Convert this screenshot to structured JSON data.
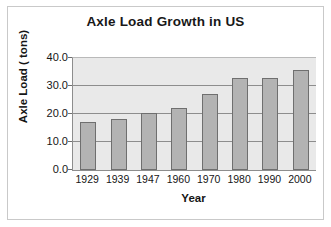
{
  "figure": {
    "title": "Axle Load Growth in US",
    "background_color": "#ffffff",
    "frame_color": "#c9c9c9",
    "plot_background_color": "#e9e9e9",
    "bar_fill_color": "#b3b3b3",
    "bar_border_color": "#6f6f6f",
    "gridline_color": "#8d8d8d",
    "text_color": "#161616"
  },
  "chart_data": {
    "type": "bar",
    "title": "Axle Load Growth in US",
    "xlabel": "Year",
    "ylabel": "Axle Load ( tons)",
    "categories": [
      "1929",
      "1939",
      "1947",
      "1960",
      "1970",
      "1980",
      "1990",
      "2000"
    ],
    "values": [
      17.3,
      18.2,
      20.3,
      22.0,
      27.0,
      32.8,
      32.9,
      35.8
    ],
    "ylim": [
      0.0,
      40.0
    ],
    "ytick_labels": [
      "40.0",
      "30.0",
      "20.0",
      "10.0",
      "0.0"
    ],
    "ytick_values": [
      40.0,
      30.0,
      20.0,
      10.0,
      0.0
    ],
    "grid": true,
    "grid_axis": "y",
    "legend": false,
    "legend_position": "none",
    "series": [
      {
        "name": "Axle Load",
        "values": [
          17.3,
          18.2,
          20.3,
          22.0,
          27.0,
          32.8,
          32.9,
          35.8
        ]
      }
    ]
  }
}
